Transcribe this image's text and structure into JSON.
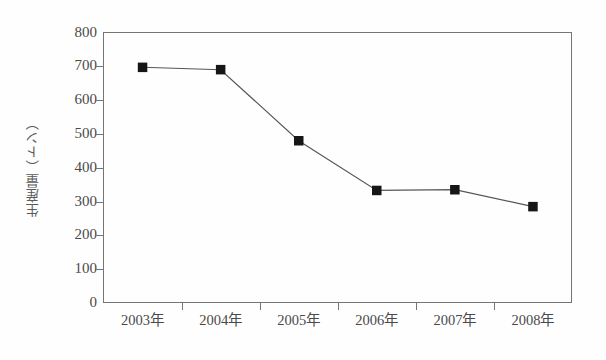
{
  "chart_data": {
    "type": "line",
    "title": "",
    "subtitle": "",
    "xlabel": "",
    "ylabel": "生産量（トン）",
    "categories": [
      "2003年",
      "2004年",
      "2005年",
      "2006年",
      "2007年",
      "2008年"
    ],
    "values": [
      697,
      690,
      480,
      333,
      335,
      285
    ],
    "series": [
      {
        "name": "生産量",
        "values": [
          697,
          690,
          480,
          333,
          335,
          285
        ]
      }
    ],
    "ylim": [
      0,
      800
    ],
    "ytick_labels": [
      "800",
      "700",
      "600",
      "500",
      "400",
      "300",
      "200",
      "100",
      "0"
    ],
    "ytick_values": [
      800,
      700,
      600,
      500,
      400,
      300,
      200,
      100,
      0
    ],
    "ytick_step": 100,
    "grid": false,
    "legend": false,
    "legend_position": "none",
    "marker": "filled-square",
    "marker_color": "#161616",
    "line_color": "#565656",
    "axis_color": "#757575",
    "background_color": "#fefefe"
  },
  "axes": {
    "y_title": "生産量（トン）"
  }
}
